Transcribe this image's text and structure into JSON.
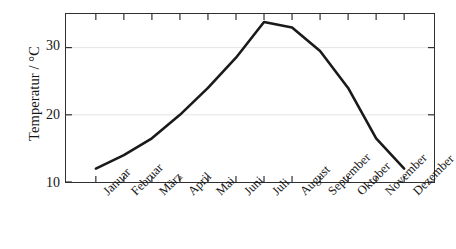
{
  "chart_data": {
    "type": "line",
    "title": "",
    "subtitle": "",
    "xlabel": "",
    "ylabel": "Temperatur / °C",
    "categories": [
      "Januar",
      "Februar",
      "März",
      "April",
      "Mai",
      "Juni",
      "Juli",
      "August",
      "September",
      "Oktober",
      "November",
      "Dezember"
    ],
    "values": [
      12.0,
      14.0,
      16.5,
      20.0,
      24.0,
      28.5,
      33.8,
      33.0,
      29.5,
      24.0,
      16.5,
      12.0
    ],
    "series": [
      {
        "name": "Temperatur",
        "values": [
          12.0,
          14.0,
          16.5,
          20.0,
          24.0,
          28.5,
          33.8,
          33.0,
          29.5,
          24.0,
          16.5,
          12.0
        ]
      }
    ],
    "ylim": [
      10,
      35
    ],
    "yticks": [
      10,
      20,
      30
    ],
    "ytick_labels": [
      "10",
      "20",
      "30"
    ],
    "xtick_labels": [
      "Januar",
      "Februar",
      "März",
      "April",
      "Mai",
      "Juni",
      "Juli",
      "August",
      "September",
      "Oktober",
      "November",
      "Dezember"
    ],
    "grid": false,
    "legend": null,
    "legend_position": "none",
    "line_color": "#1a1a1a",
    "axis_color": "#303030",
    "background_color": "#ffffff",
    "annotations": []
  },
  "axes": {
    "y_title": "Temperatur / °C",
    "y_ticks": [
      {
        "label": "30",
        "value": 30
      },
      {
        "label": "20",
        "value": 20
      },
      {
        "label": "10",
        "value": 10
      }
    ],
    "x_ticks": [
      {
        "label": "Januar"
      },
      {
        "label": "Februar"
      },
      {
        "label": "März"
      },
      {
        "label": "April"
      },
      {
        "label": "Mai"
      },
      {
        "label": "Juni"
      },
      {
        "label": "Juli"
      },
      {
        "label": "August"
      },
      {
        "label": "September"
      },
      {
        "label": "Oktober"
      },
      {
        "label": "November"
      },
      {
        "label": "Dezember"
      }
    ]
  }
}
